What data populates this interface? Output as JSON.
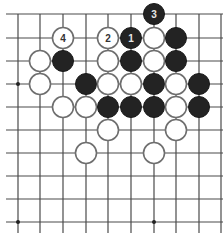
{
  "diagram": {
    "type": "go-board",
    "grid": {
      "columns_x": [
        18,
        40,
        63,
        86,
        108,
        131,
        154,
        176,
        199,
        221
      ],
      "rows_y": [
        14,
        38,
        61,
        84,
        107,
        130,
        153,
        176,
        199,
        222
      ],
      "line_left": 6,
      "line_right": 223,
      "line_top": 14,
      "line_bottom": 233
    },
    "colors": {
      "black_stone": "#232323",
      "white_stone_fill": "#ffffff",
      "white_stone_stroke": "#6e6e6e",
      "grid": "#4a4a4a"
    },
    "stone_radius": 10.5,
    "star_points": [
      {
        "col": 0,
        "row": 3
      },
      {
        "col": 0,
        "row": 9
      },
      {
        "col": 6,
        "row": 9
      }
    ],
    "stones": [
      {
        "color": "black",
        "col": 6,
        "row": 0,
        "label": "3"
      },
      {
        "color": "white",
        "col": 2,
        "row": 1,
        "label": "4"
      },
      {
        "color": "white",
        "col": 4,
        "row": 1,
        "label": "2"
      },
      {
        "color": "black",
        "col": 5,
        "row": 1,
        "label": "1"
      },
      {
        "color": "white",
        "col": 6,
        "row": 1,
        "label": ""
      },
      {
        "color": "black",
        "col": 7,
        "row": 1,
        "label": ""
      },
      {
        "color": "white",
        "col": 1,
        "row": 2,
        "label": ""
      },
      {
        "color": "black",
        "col": 2,
        "row": 2,
        "label": ""
      },
      {
        "color": "white",
        "col": 4,
        "row": 2,
        "label": ""
      },
      {
        "color": "black",
        "col": 5,
        "row": 2,
        "label": ""
      },
      {
        "color": "white",
        "col": 6,
        "row": 2,
        "label": ""
      },
      {
        "color": "black",
        "col": 7,
        "row": 2,
        "label": ""
      },
      {
        "color": "white",
        "col": 1,
        "row": 3,
        "label": ""
      },
      {
        "color": "black",
        "col": 3,
        "row": 3,
        "label": ""
      },
      {
        "color": "white",
        "col": 4,
        "row": 3,
        "label": ""
      },
      {
        "color": "white",
        "col": 5,
        "row": 3,
        "label": ""
      },
      {
        "color": "black",
        "col": 6,
        "row": 3,
        "label": ""
      },
      {
        "color": "white",
        "col": 7,
        "row": 3,
        "label": ""
      },
      {
        "color": "black",
        "col": 8,
        "row": 3,
        "label": ""
      },
      {
        "color": "white",
        "col": 2,
        "row": 4,
        "label": ""
      },
      {
        "color": "white",
        "col": 3,
        "row": 4,
        "label": ""
      },
      {
        "color": "black",
        "col": 4,
        "row": 4,
        "label": ""
      },
      {
        "color": "black",
        "col": 5,
        "row": 4,
        "label": ""
      },
      {
        "color": "black",
        "col": 6,
        "row": 4,
        "label": ""
      },
      {
        "color": "white",
        "col": 7,
        "row": 4,
        "label": ""
      },
      {
        "color": "black",
        "col": 8,
        "row": 4,
        "label": ""
      },
      {
        "color": "white",
        "col": 4,
        "row": 5,
        "label": ""
      },
      {
        "color": "white",
        "col": 7,
        "row": 5,
        "label": ""
      },
      {
        "color": "white",
        "col": 3,
        "row": 6,
        "label": ""
      },
      {
        "color": "white",
        "col": 6,
        "row": 6,
        "label": ""
      }
    ]
  }
}
